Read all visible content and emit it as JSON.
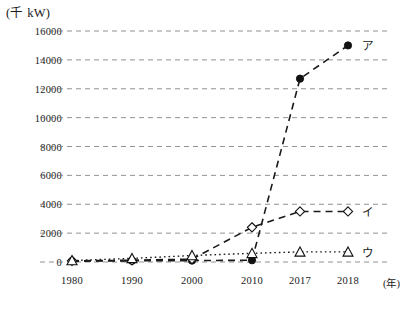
{
  "chart_data": {
    "type": "line",
    "title": "",
    "subtitle": "",
    "xlabel": "(年)",
    "ylabel": "(千 kW)",
    "categories": [
      "1980",
      "1990",
      "2000",
      "2010",
      "2017",
      "2018"
    ],
    "x_tick_labels": [
      "1980",
      "1990",
      "2000",
      "2010",
      "2017",
      "2018"
    ],
    "y_tick_labels": [
      "0",
      "2000",
      "4000",
      "6000",
      "8000",
      "10000",
      "12000",
      "14000",
      "16000"
    ],
    "y_ticks": [
      0,
      2000,
      4000,
      6000,
      8000,
      10000,
      12000,
      14000,
      16000
    ],
    "ylim": [
      0,
      16000
    ],
    "grid": true,
    "grid_style": "dashed-horizontal",
    "legend_position": "right-of-line-ends",
    "series": [
      {
        "name": "ア",
        "label": "ア",
        "marker": "filled-circle",
        "line_style": "dashed",
        "color": "#1a1a1a",
        "values": [
          60,
          80,
          100,
          120,
          12700,
          15000
        ]
      },
      {
        "name": "イ",
        "label": "イ",
        "marker": "open-diamond",
        "line_style": "dashed",
        "color": "#1a1a1a",
        "values": [
          80,
          120,
          200,
          2400,
          3500,
          3500
        ]
      },
      {
        "name": "ウ",
        "label": "ウ",
        "marker": "open-triangle",
        "line_style": "dotted",
        "color": "#1a1a1a",
        "values": [
          100,
          250,
          450,
          600,
          700,
          700
        ]
      }
    ]
  },
  "axes": {
    "y_unit": "(千 kW)",
    "x_unit": "(年)"
  }
}
